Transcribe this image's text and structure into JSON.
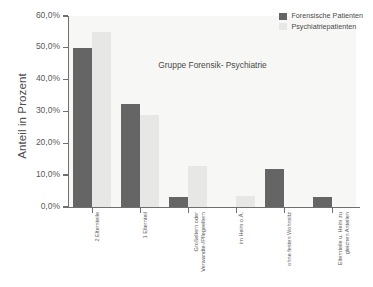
{
  "chart_data": {
    "type": "bar",
    "title": "Gruppe Forensik- Psychiatrie",
    "xlabel": "",
    "ylabel": "Anteil in Prozent",
    "ylim": [
      0,
      60
    ],
    "ytick_labels": [
      "0,0%",
      "10,0%",
      "20,0%",
      "30,0%",
      "40,0%",
      "50,0%",
      "60,0%"
    ],
    "ytick_values": [
      0,
      10,
      20,
      30,
      40,
      50,
      60
    ],
    "grid": false,
    "legend_position": "top-right",
    "categories": [
      "2 Elternteile",
      "1 Elternteil",
      "Großeltern oder\nVerwandte-/Pflegeeltern",
      "im Heim o.Ä.",
      "ohne festen Wohnsitz",
      "Elternteile u. Heim zu\ngleichen Anteilen"
    ],
    "series": [
      {
        "name": "Forensische Patienten",
        "color": "#656565",
        "values": [
          50.0,
          32.5,
          3.0,
          0.0,
          12.0,
          3.0
        ]
      },
      {
        "name": "Psychiatriepatienten",
        "color": "#e7e7e5",
        "values": [
          55.0,
          29.0,
          13.0,
          3.5,
          0.0,
          0.0
        ]
      }
    ]
  },
  "axis": {
    "y_title": "Anteil in Prozent"
  }
}
